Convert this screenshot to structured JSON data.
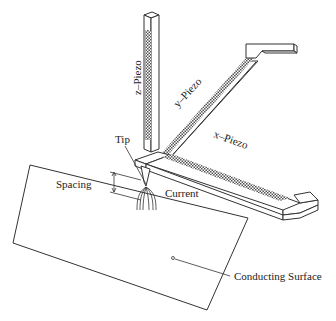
{
  "diagram": {
    "type": "schematic",
    "labels": {
      "z_piezo": "z–Piezo",
      "y_piezo": "y–Piezo",
      "x_piezo": "x–Piezo",
      "tip": "Tip",
      "spacing": "Spacing",
      "current": "Current",
      "conducting_surface": "Conducting Surface"
    },
    "colors": {
      "line": "#333333",
      "background": "#ffffff",
      "hatch": "#555555"
    }
  }
}
